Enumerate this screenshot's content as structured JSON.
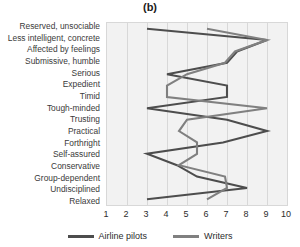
{
  "chart_data": {
    "type": "line",
    "title": "(b)",
    "xlabel": "",
    "ylabel": "",
    "xlim": [
      1,
      10
    ],
    "ylim": [
      0,
      15
    ],
    "grid": true,
    "orientation": "horizontal-categories",
    "legend_position": "bottom",
    "xticks": [
      1,
      2,
      3,
      4,
      5,
      6,
      7,
      8,
      9,
      10
    ],
    "categories": [
      "Reserved, unsociable",
      "Less intelligent, concrete",
      "Affected by feelings",
      "Submissive, humble",
      "Serious",
      "Expedient",
      "Timid",
      "Tough-minded",
      "Trusting",
      "Practical",
      "Forthright",
      "Self-assured",
      "Conservative",
      "Group-dependent",
      "Undisciplined",
      "Relaxed"
    ],
    "series": [
      {
        "name": "Airline pilots",
        "color": "#4d4d4d",
        "values": [
          3.0,
          9.0,
          7.5,
          7.0,
          4.0,
          7.0,
          7.0,
          3.0,
          7.0,
          9.0,
          6.8,
          3.0,
          4.5,
          5.5,
          8.0,
          3.0
        ]
      },
      {
        "name": "Writers",
        "color": "#808080",
        "values": [
          6.0,
          9.0,
          7.4,
          6.9,
          5.0,
          4.0,
          4.0,
          9.0,
          5.0,
          4.6,
          5.5,
          5.5,
          4.6,
          6.9,
          7.0,
          6.0
        ]
      }
    ]
  },
  "legend": {
    "items": [
      {
        "label": "Airline pilots",
        "color": "#4d4d4d"
      },
      {
        "label": "Writers",
        "color": "#808080"
      }
    ]
  },
  "colors": {
    "plot_background": "#f2f2f2",
    "gridline": "#d8d8d8",
    "label_text": "#3a3a3a",
    "axis_text": "#2c2c2c",
    "airline_pilots": "#4d4d4d",
    "writers": "#808080"
  }
}
